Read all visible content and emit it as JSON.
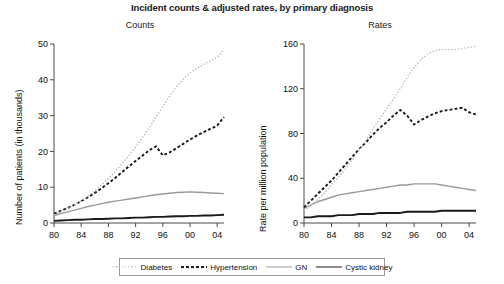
{
  "title": "Incident counts & adjusted rates, by primary diagnosis",
  "panels": [
    {
      "key": "counts",
      "title": "Counts",
      "ylabel": "Number of patients (in thousands)"
    },
    {
      "key": "rates",
      "title": "Rates",
      "ylabel": "Rate per million population"
    }
  ],
  "legend": {
    "items": [
      {
        "label": "Diabetes",
        "color": "#b8b8b8",
        "style": "dotted",
        "width": 1.4
      },
      {
        "label": "Hypertension",
        "color": "#1a1a1a",
        "style": "dashed",
        "width": 1.9
      },
      {
        "label": "GN",
        "color": "#9a9a9a",
        "style": "solid",
        "width": 1.4
      },
      {
        "label": "Cystic kidney",
        "color": "#1a1a1a",
        "style": "solid",
        "width": 1.9
      }
    ]
  },
  "chart_data": [
    {
      "type": "line",
      "title": "Counts",
      "xlabel": "",
      "ylabel": "Number of patients (in thousands)",
      "x": [
        1980,
        1981,
        1982,
        1983,
        1984,
        1985,
        1986,
        1987,
        1988,
        1989,
        1990,
        1991,
        1992,
        1993,
        1994,
        1995,
        1996,
        1997,
        1998,
        1999,
        2000,
        2001,
        2002,
        2003,
        2004,
        2005
      ],
      "xtick_values": [
        1980,
        1984,
        1988,
        1992,
        1996,
        2000,
        2004
      ],
      "xtick_labels": [
        "80",
        "84",
        "88",
        "92",
        "96",
        "00",
        "04"
      ],
      "xlim": [
        1980,
        2005
      ],
      "ytick_values": [
        0,
        10,
        20,
        30,
        40,
        50
      ],
      "ytick_labels": [
        "0",
        "10",
        "20",
        "30",
        "40",
        "50"
      ],
      "ylim": [
        0,
        50
      ],
      "grid": false,
      "legend_position": "bottom",
      "series": [
        {
          "name": "Diabetes",
          "values": [
            2.3,
            3.1,
            4.0,
            5.0,
            6.2,
            7.5,
            9.0,
            10.6,
            12.4,
            14.4,
            16.5,
            18.8,
            21.2,
            23.8,
            26.6,
            29.6,
            32.6,
            35.4,
            38.0,
            40.2,
            41.9,
            43.2,
            44.3,
            45.3,
            46.3,
            48.4
          ]
        },
        {
          "name": "Hypertension",
          "values": [
            2.6,
            3.4,
            4.2,
            5.1,
            6.1,
            7.2,
            8.4,
            9.7,
            11.1,
            12.6,
            14.2,
            15.8,
            17.3,
            18.8,
            20.3,
            21.4,
            18.9,
            19.7,
            20.9,
            22.1,
            23.3,
            24.4,
            25.4,
            26.3,
            27.2,
            29.6
          ]
        },
        {
          "name": "GN",
          "values": [
            2.1,
            2.6,
            3.1,
            3.6,
            4.1,
            4.6,
            5.0,
            5.4,
            5.8,
            6.1,
            6.4,
            6.7,
            7.0,
            7.3,
            7.6,
            7.9,
            8.1,
            8.3,
            8.5,
            8.6,
            8.7,
            8.6,
            8.5,
            8.4,
            8.3,
            8.2
          ]
        },
        {
          "name": "Cystic kidney",
          "values": [
            0.6,
            0.7,
            0.8,
            0.9,
            0.9,
            1.0,
            1.1,
            1.1,
            1.2,
            1.3,
            1.3,
            1.4,
            1.5,
            1.5,
            1.6,
            1.7,
            1.7,
            1.8,
            1.9,
            1.9,
            2.0,
            2.0,
            2.1,
            2.1,
            2.2,
            2.3
          ]
        }
      ]
    },
    {
      "type": "line",
      "title": "Rates",
      "xlabel": "",
      "ylabel": "Rate per million population",
      "x": [
        1980,
        1981,
        1982,
        1983,
        1984,
        1985,
        1986,
        1987,
        1988,
        1989,
        1990,
        1991,
        1992,
        1993,
        1994,
        1995,
        1996,
        1997,
        1998,
        1999,
        2000,
        2001,
        2002,
        2003,
        2004,
        2005
      ],
      "xtick_values": [
        1980,
        1984,
        1988,
        1992,
        1996,
        2000,
        2004
      ],
      "xtick_labels": [
        "80",
        "84",
        "88",
        "92",
        "96",
        "00",
        "04"
      ],
      "xlim": [
        1980,
        2005
      ],
      "ytick_values": [
        0,
        40,
        80,
        120,
        160
      ],
      "ytick_labels": [
        "0",
        "40",
        "80",
        "120",
        "160"
      ],
      "ylim": [
        0,
        160
      ],
      "grid": false,
      "legend_position": "bottom",
      "series": [
        {
          "name": "Diabetes",
          "values": [
            11,
            16,
            21,
            27,
            34,
            41,
            48,
            56,
            65,
            74,
            84,
            93,
            102,
            111,
            120,
            130,
            139,
            146,
            151,
            154,
            155,
            155,
            155,
            156,
            157,
            158
          ]
        },
        {
          "name": "Hypertension",
          "values": [
            14,
            20,
            26,
            32,
            38,
            45,
            52,
            59,
            66,
            72,
            79,
            85,
            90,
            96,
            101,
            96,
            88,
            92,
            95,
            98,
            100,
            101,
            102,
            103,
            99,
            97
          ]
        },
        {
          "name": "GN",
          "values": [
            13,
            16,
            19,
            21,
            23,
            25,
            26,
            27,
            28,
            29,
            30,
            31,
            32,
            33,
            34,
            34,
            35,
            35,
            35,
            35,
            34,
            33,
            32,
            31,
            30,
            29
          ]
        },
        {
          "name": "Cystic kidney",
          "values": [
            5,
            5,
            6,
            6,
            6,
            7,
            7,
            7,
            8,
            8,
            8,
            9,
            9,
            9,
            9,
            10,
            10,
            10,
            10,
            10,
            11,
            11,
            11,
            11,
            11,
            11
          ]
        }
      ]
    }
  ]
}
